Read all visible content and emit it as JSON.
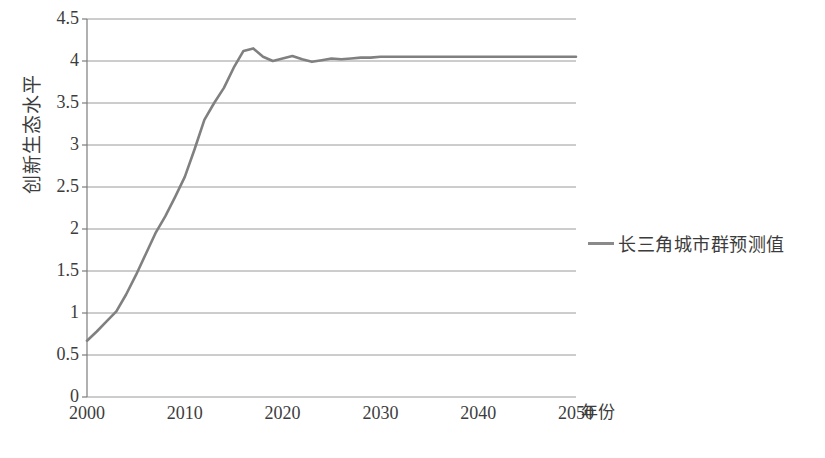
{
  "chart_data": {
    "type": "line",
    "title": "",
    "xlabel": "年份",
    "ylabel": "创新生态水平",
    "xlim": [
      2000,
      2050
    ],
    "ylim": [
      0,
      4.5
    ],
    "grid": true,
    "legend_position": "right",
    "x_ticks": [
      "2000",
      "2010",
      "2020",
      "2030",
      "2040",
      "2050"
    ],
    "x_tick_values": [
      2000,
      2010,
      2020,
      2030,
      2040,
      2050
    ],
    "y_ticks": [
      "0",
      "0.5",
      "1",
      "1.5",
      "2",
      "2.5",
      "3",
      "3.5",
      "4",
      "4.5"
    ],
    "y_tick_values": [
      0,
      0.5,
      1,
      1.5,
      2,
      2.5,
      3,
      3.5,
      4,
      4.5
    ],
    "series": [
      {
        "name": "长三角城市群预测值",
        "color": "#808080",
        "x": [
          2000,
          2001,
          2002,
          2003,
          2004,
          2005,
          2006,
          2007,
          2008,
          2009,
          2010,
          2011,
          2012,
          2013,
          2014,
          2015,
          2016,
          2017,
          2018,
          2019,
          2020,
          2021,
          2022,
          2023,
          2024,
          2025,
          2026,
          2027,
          2028,
          2029,
          2030,
          2031,
          2032,
          2033,
          2034,
          2035,
          2036,
          2037,
          2038,
          2039,
          2040,
          2041,
          2042,
          2043,
          2044,
          2045,
          2046,
          2047,
          2048,
          2049,
          2050
        ],
        "values": [
          0.67,
          0.78,
          0.9,
          1.02,
          1.22,
          1.45,
          1.7,
          1.95,
          2.15,
          2.38,
          2.62,
          2.95,
          3.3,
          3.5,
          3.68,
          3.92,
          4.12,
          4.15,
          4.05,
          4.0,
          4.03,
          4.06,
          4.02,
          3.99,
          4.01,
          4.03,
          4.02,
          4.03,
          4.04,
          4.04,
          4.05,
          4.05,
          4.05,
          4.05,
          4.05,
          4.05,
          4.05,
          4.05,
          4.05,
          4.05,
          4.05,
          4.05,
          4.05,
          4.05,
          4.05,
          4.05,
          4.05,
          4.05,
          4.05,
          4.05,
          4.05
        ]
      }
    ]
  },
  "legend": {
    "entries": [
      {
        "label": "长三角城市群预测值"
      }
    ]
  },
  "axes": {
    "y_title": "创新生态水平",
    "x_unit": "年份"
  }
}
